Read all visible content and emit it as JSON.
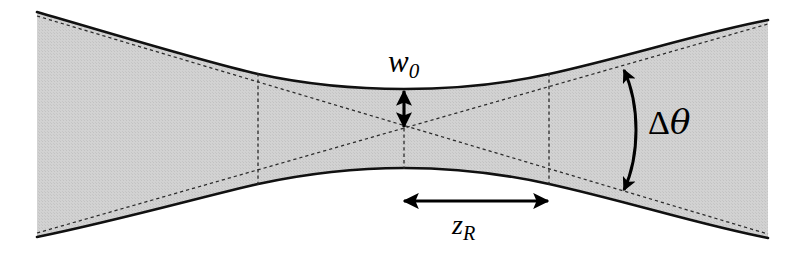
{
  "figure": {
    "type": "diagram",
    "width": 797,
    "height": 254,
    "background_color": "#ffffff",
    "beam_fill_color": "#cfcfcf",
    "beam_outline_color": "#111111",
    "dashed_line_color": "#333333",
    "arrow_color": "#000000"
  },
  "labels": {
    "waist": {
      "text": "w",
      "subscript": "0",
      "name": "beam-waist-radius-label"
    },
    "rayleigh": {
      "text": "z",
      "subscript": "R",
      "name": "rayleigh-range-label"
    },
    "divergence": {
      "delta": "Δ",
      "theta": "θ",
      "name": "divergence-angle-label"
    }
  },
  "geometry": {
    "waist_center": {
      "x": 404,
      "y": 128
    },
    "waist_half_width": 39,
    "rayleigh_line_left_x": 258,
    "rayleigh_line_right_x": 549,
    "beam_left_x": 37,
    "beam_right_x": 768,
    "beam_left_half_width": 112,
    "beam_right_half_width": 109,
    "waist_arrow": {
      "x": 404,
      "y_top": 90,
      "y_bottom": 128
    },
    "rayleigh_arrow": {
      "y": 201,
      "x_start": 403,
      "x_end": 549
    },
    "divergence_arc": {
      "x_ends": 622,
      "x_bulge": 636,
      "y_top": 67,
      "y_bottom": 193
    }
  },
  "annotations": {
    "waist_arrow_name": "waist-dimension-arrow",
    "rayleigh_arrow_name": "rayleigh-range-arrow",
    "divergence_arc_name": "divergence-angle-arc-arrow",
    "beam_envelope_name": "gaussian-beam-envelope",
    "asymptote_name": "beam-asymptote-dashed-line",
    "rayleigh_marker_name": "rayleigh-marker-dashed-line"
  }
}
